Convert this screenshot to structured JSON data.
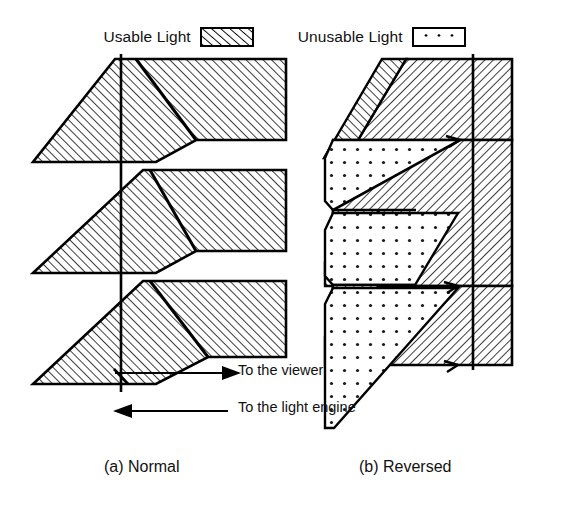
{
  "legend": {
    "items": [
      {
        "label": "Usable Light",
        "swatch": "diagonal-hatch-swatch",
        "pattern": "hatch"
      },
      {
        "label": "Unusable Light",
        "swatch": "dotted-swatch",
        "pattern": "dots"
      }
    ]
  },
  "annotations": {
    "viewer_arrow_label": "To the viewer",
    "viewer_arrow_direction": "right",
    "engine_arrow_label": "To the light engine",
    "engine_arrow_direction": "left"
  },
  "captions": {
    "left": "(a) Normal",
    "right": "(b) Reversed"
  },
  "diagrams": [
    {
      "id": "normal",
      "name": "normal-prism-diagram",
      "caption": "(a) Normal",
      "hatch_direction": "forward-slash",
      "regions": [
        "usable-light"
      ],
      "teeth": 3,
      "description": "Sawtooth prism cross-section, all material hatched as usable light, with white triangular notches opening to the right"
    },
    {
      "id": "reversed",
      "name": "reversed-prism-diagram",
      "caption": "(b) Reversed",
      "hatch_direction": "back-slash",
      "regions": [
        "usable-light",
        "unusable-light"
      ],
      "teeth": 3,
      "description": "Reversed sawtooth prism cross-section with alternating hatched usable-light wedges and dotted unusable-light wedges"
    }
  ]
}
